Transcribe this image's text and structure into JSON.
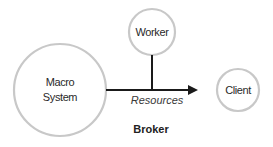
{
  "diagram": {
    "nodes": [
      {
        "id": "macro",
        "label_line1": "Macro",
        "label_line2": "System",
        "shape": "circle"
      },
      {
        "id": "worker",
        "label": "Worker",
        "shape": "circle"
      },
      {
        "id": "client",
        "label": "Client",
        "shape": "circle"
      }
    ],
    "edges": [
      {
        "from": "macro",
        "to": "client",
        "label": "Resources",
        "style": "arrow"
      },
      {
        "from": "worker",
        "to": "macro-client-edge",
        "label": "",
        "style": "line"
      }
    ],
    "group_label": "Broker",
    "colors": {
      "circle_stroke": "#c8c8c8",
      "line": "#1a1a1a",
      "text": "#2a2a2a"
    }
  }
}
